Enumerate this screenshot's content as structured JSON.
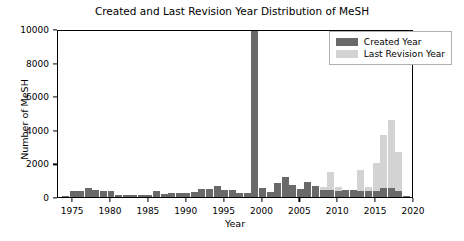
{
  "chart_data": {
    "type": "bar",
    "title": "Created and Last Revision Year Distribution of MeSH",
    "xlabel": "Year",
    "ylabel": "Number of MeSH",
    "xlim": [
      1973,
      2020
    ],
    "ylim": [
      0,
      10000
    ],
    "grid": false,
    "legend_position": "upper right",
    "bar_style": "overlaid",
    "categories": [
      1974,
      1975,
      1976,
      1977,
      1978,
      1979,
      1980,
      1981,
      1982,
      1983,
      1984,
      1985,
      1986,
      1987,
      1988,
      1989,
      1990,
      1991,
      1992,
      1993,
      1994,
      1995,
      1996,
      1997,
      1998,
      1999,
      2000,
      2001,
      2002,
      2003,
      2004,
      2005,
      2006,
      2007,
      2008,
      2009,
      2010,
      2011,
      2012,
      2013,
      2014,
      2015,
      2016,
      2017,
      2018,
      2019
    ],
    "series": [
      {
        "name": "Created Year",
        "color": "#696969",
        "values": [
          60,
          330,
          330,
          560,
          400,
          350,
          340,
          130,
          110,
          110,
          120,
          120,
          330,
          200,
          210,
          230,
          250,
          300,
          460,
          450,
          640,
          400,
          420,
          250,
          260,
          10000,
          560,
          300,
          820,
          1200,
          700,
          480,
          920,
          660,
          440,
          440,
          380,
          400,
          400,
          380,
          330,
          380,
          560,
          520,
          380,
          60
        ]
      },
      {
        "name": "Last Revision Year",
        "color": "#d3d3d3",
        "values": [
          0,
          0,
          0,
          0,
          0,
          0,
          0,
          0,
          0,
          0,
          0,
          0,
          0,
          0,
          0,
          0,
          0,
          0,
          0,
          0,
          0,
          0,
          0,
          0,
          0,
          0,
          0,
          0,
          0,
          0,
          0,
          0,
          0,
          0,
          600,
          1480,
          620,
          440,
          440,
          1620,
          620,
          2000,
          3700,
          4600,
          2650,
          0
        ]
      }
    ],
    "yticks": [
      0,
      2000,
      4000,
      6000,
      8000,
      10000
    ],
    "xticks": [
      1975,
      1980,
      1985,
      1990,
      1995,
      2000,
      2005,
      2010,
      2015,
      2020
    ],
    "annotations": [
      "1999 Created Year bar reaches the top of the axis at 10000"
    ]
  },
  "legend": {
    "items": [
      {
        "label": "Created Year"
      },
      {
        "label": "Last Revision Year"
      }
    ]
  }
}
